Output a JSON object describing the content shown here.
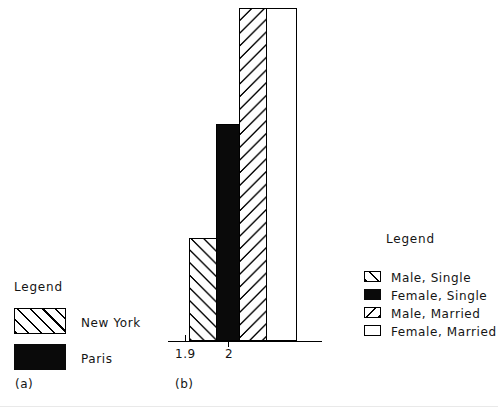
{
  "figure": {
    "background": "#ffffff",
    "ink": "#000000"
  },
  "panel_a": {
    "caption": "(a)",
    "legend": {
      "title": "Legend",
      "entries": [
        {
          "label": "New York",
          "pattern": "forward-hatch",
          "color": "#ffffff"
        },
        {
          "label": "Paris",
          "pattern": "solid",
          "color": "#0a0a0a"
        }
      ]
    }
  },
  "panel_b": {
    "caption": "(b)",
    "axis": {
      "ticks": [
        "1.9",
        "2"
      ]
    },
    "legend": {
      "title": "Legend",
      "entries": [
        {
          "label": "Male, Single",
          "pattern": "forward-hatch",
          "color": "#ffffff"
        },
        {
          "label": "Female, Single",
          "pattern": "solid",
          "color": "#0a0a0a"
        },
        {
          "label": "Male, Married",
          "pattern": "backward-hatch",
          "color": "#ffffff"
        },
        {
          "label": "Female, Married",
          "pattern": "blank",
          "color": "#ffffff"
        }
      ]
    }
  },
  "chart_data": {
    "type": "bar",
    "title": "",
    "xlabel": "",
    "ylabel": "",
    "grid": false,
    "legend_position": "right",
    "categories": [
      "Male, Single",
      "Female, Single",
      "Male, Married",
      "Female, Married"
    ],
    "values": [
      103,
      217,
      333,
      333
    ],
    "ylim": [
      0,
      341
    ],
    "xtick_labels": [
      "1.9",
      "2"
    ],
    "xtick_positions": [
      1.9,
      2
    ],
    "bars": [
      {
        "category": "Male, Single",
        "value": 103,
        "pattern": "forward-hatch",
        "color": "#ffffff"
      },
      {
        "category": "Female, Single",
        "value": 217,
        "pattern": "solid",
        "color": "#0a0a0a"
      },
      {
        "category": "Male, Married",
        "value": 333,
        "pattern": "backward-hatch",
        "color": "#ffffff"
      },
      {
        "category": "Female, Married",
        "value": 333,
        "pattern": "blank",
        "color": "#ffffff"
      }
    ]
  }
}
